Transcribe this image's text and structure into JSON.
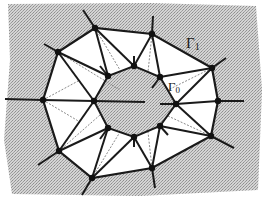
{
  "figure": {
    "type": "mesh-diagram",
    "colors": {
      "background_fill": "#c8c8c8",
      "region_fill": "#ffffff",
      "edge": "#1a1a1a",
      "dashed_edge": "#8a8a8a",
      "node": "#111111"
    },
    "labels": {
      "outer_boundary": {
        "symbol": "Γ",
        "subscript": "1"
      },
      "inner_boundary": {
        "symbol": "Γ",
        "subscript": "0"
      }
    },
    "outer_nodes": [
      [
        43,
        100
      ],
      [
        58,
        52
      ],
      [
        95,
        28
      ],
      [
        152,
        34
      ],
      [
        212,
        68
      ],
      [
        218,
        101
      ],
      [
        211,
        136
      ],
      [
        152,
        168
      ],
      [
        92,
        178
      ],
      [
        59,
        151
      ]
    ],
    "inner_nodes": [
      [
        94,
        101
      ],
      [
        108,
        76
      ],
      [
        134,
        66
      ],
      [
        160,
        77
      ],
      [
        176,
        104
      ],
      [
        160,
        126
      ],
      [
        134,
        137
      ],
      [
        108,
        128
      ]
    ],
    "outer_spokes": [
      [
        [
          43,
          100
        ],
        [
          5,
          99
        ]
      ],
      [
        [
          58,
          52
        ],
        [
          44,
          44
        ]
      ],
      [
        [
          95,
          28
        ],
        [
          83,
          10
        ]
      ],
      [
        [
          152,
          34
        ],
        [
          153,
          16
        ]
      ],
      [
        [
          212,
          68
        ],
        [
          226,
          58
        ]
      ],
      [
        [
          218,
          101
        ],
        [
          244,
          101
        ]
      ],
      [
        [
          211,
          136
        ],
        [
          234,
          148
        ]
      ],
      [
        [
          152,
          168
        ],
        [
          155,
          188
        ]
      ],
      [
        [
          92,
          178
        ],
        [
          82,
          195
        ]
      ],
      [
        [
          59,
          151
        ],
        [
          38,
          165
        ]
      ]
    ],
    "inner_spokes": [
      [
        [
          94,
          101
        ],
        [
          145,
          102
        ]
      ],
      [
        [
          108,
          76
        ],
        [
          100,
          66
        ]
      ],
      [
        [
          134,
          66
        ],
        [
          134,
          56
        ]
      ],
      [
        [
          160,
          77
        ],
        [
          152,
          88
        ]
      ],
      [
        [
          176,
          104
        ],
        [
          160,
          104
        ]
      ],
      [
        [
          160,
          126
        ],
        [
          168,
          135
        ]
      ],
      [
        [
          134,
          137
        ],
        [
          134,
          147
        ]
      ],
      [
        [
          108,
          128
        ],
        [
          100,
          139
        ]
      ]
    ],
    "cross_edges": [
      [
        [
          43,
          100
        ],
        [
          94,
          101
        ]
      ],
      [
        [
          58,
          52
        ],
        [
          94,
          101
        ]
      ],
      [
        [
          58,
          52
        ],
        [
          108,
          76
        ]
      ],
      [
        [
          95,
          28
        ],
        [
          108,
          76
        ]
      ],
      [
        [
          95,
          28
        ],
        [
          134,
          66
        ]
      ],
      [
        [
          152,
          34
        ],
        [
          134,
          66
        ]
      ],
      [
        [
          152,
          34
        ],
        [
          160,
          77
        ]
      ],
      [
        [
          212,
          68
        ],
        [
          160,
          77
        ]
      ],
      [
        [
          212,
          68
        ],
        [
          176,
          104
        ]
      ],
      [
        [
          218,
          101
        ],
        [
          176,
          104
        ]
      ],
      [
        [
          211,
          136
        ],
        [
          176,
          104
        ]
      ],
      [
        [
          211,
          136
        ],
        [
          160,
          126
        ]
      ],
      [
        [
          152,
          168
        ],
        [
          160,
          126
        ]
      ],
      [
        [
          152,
          168
        ],
        [
          134,
          137
        ]
      ],
      [
        [
          92,
          178
        ],
        [
          134,
          137
        ]
      ],
      [
        [
          92,
          178
        ],
        [
          108,
          128
        ]
      ],
      [
        [
          59,
          151
        ],
        [
          108,
          128
        ]
      ],
      [
        [
          59,
          151
        ],
        [
          94,
          101
        ]
      ]
    ],
    "dashed_edges": [
      [
        [
          58,
          52
        ],
        [
          120,
          90
        ]
      ],
      [
        [
          95,
          28
        ],
        [
          120,
          70
        ]
      ],
      [
        [
          152,
          34
        ],
        [
          148,
          72
        ]
      ],
      [
        [
          212,
          68
        ],
        [
          168,
          90
        ]
      ],
      [
        [
          211,
          136
        ],
        [
          168,
          116
        ]
      ],
      [
        [
          152,
          168
        ],
        [
          148,
          132
        ]
      ],
      [
        [
          92,
          178
        ],
        [
          120,
          132
        ]
      ],
      [
        [
          59,
          151
        ],
        [
          100,
          115
        ]
      ],
      [
        [
          43,
          100
        ],
        [
          80,
          80
        ]
      ],
      [
        [
          43,
          100
        ],
        [
          80,
          122
        ]
      ]
    ]
  }
}
